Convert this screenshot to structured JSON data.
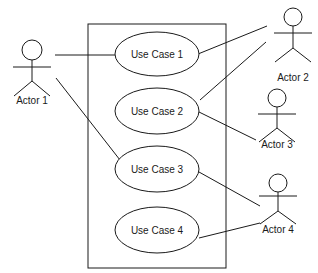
{
  "diagram": {
    "type": "uml-use-case",
    "system_boundary": {
      "x": 88,
      "y": 24,
      "width": 138,
      "height": 244
    },
    "use_cases": [
      {
        "id": "uc1",
        "label": "Use Case 1",
        "cx": 157,
        "cy": 54
      },
      {
        "id": "uc2",
        "label": "Use Case 2",
        "cx": 157,
        "cy": 111
      },
      {
        "id": "uc3",
        "label": "Use Case 3",
        "cx": 157,
        "cy": 169
      },
      {
        "id": "uc4",
        "label": "Use Case 4",
        "cx": 157,
        "cy": 230
      }
    ],
    "actors": [
      {
        "id": "a1",
        "label": "Actor 1"
      },
      {
        "id": "a2",
        "label": "Actor 2"
      },
      {
        "id": "a3",
        "label": "Actor 3"
      },
      {
        "id": "a4",
        "label": "Actor 4"
      }
    ],
    "associations": [
      {
        "from": "Actor 1",
        "to": "Use Case 1"
      },
      {
        "from": "Actor 1",
        "to": "Use Case 3"
      },
      {
        "from": "Actor 2",
        "to": "Use Case 1"
      },
      {
        "from": "Actor 2",
        "to": "Use Case 2"
      },
      {
        "from": "Actor 3",
        "to": "Use Case 2"
      },
      {
        "from": "Actor 4",
        "to": "Use Case 3"
      },
      {
        "from": "Actor 4",
        "to": "Use Case 4"
      }
    ],
    "colors": {
      "stroke": "#1a1a1a",
      "background": "#ffffff"
    }
  }
}
